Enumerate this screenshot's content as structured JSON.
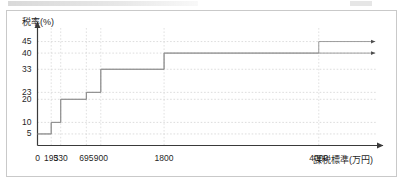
{
  "figure": {
    "title": "",
    "y_axis_label": "税率(%)",
    "x_axis_label": "課税標準(万円)"
  },
  "chart_data": {
    "type": "line",
    "subtype": "step-post",
    "title": "",
    "xlabel": "課税標準(万円)",
    "ylabel": "税率(%)",
    "grid": true,
    "grid_style": "dashed",
    "legend_position": "none",
    "x_ticks": [
      0,
      195,
      330,
      695,
      900,
      1800,
      4000
    ],
    "x_tick_labels": [
      "0",
      "195",
      "330",
      "695",
      "900",
      "1800",
      "4000"
    ],
    "y_ticks": [
      5,
      10,
      20,
      23,
      33,
      40,
      45
    ],
    "y_tick_labels": [
      "5",
      "10",
      "20",
      "23",
      "33",
      "40",
      "45"
    ],
    "xlim": [
      0,
      4800
    ],
    "ylim": [
      0,
      50
    ],
    "x_axis_arrow": true,
    "y_axis_arrow": true,
    "series": [
      {
        "name": "tax-rate-upper",
        "arrow_end": true,
        "max_rate": 45,
        "steps": [
          {
            "from": 0,
            "to": 195,
            "rate": 5
          },
          {
            "from": 195,
            "to": 330,
            "rate": 10
          },
          {
            "from": 330,
            "to": 695,
            "rate": 20
          },
          {
            "from": 695,
            "to": 900,
            "rate": 23
          },
          {
            "from": 900,
            "to": 1800,
            "rate": 33
          },
          {
            "from": 1800,
            "to": 4000,
            "rate": 40
          },
          {
            "from": 4000,
            "to": 4800,
            "rate": 45
          }
        ]
      },
      {
        "name": "tax-rate-lower",
        "arrow_end": true,
        "max_rate": 40,
        "steps": [
          {
            "from": 0,
            "to": 195,
            "rate": 5
          },
          {
            "from": 195,
            "to": 330,
            "rate": 10
          },
          {
            "from": 330,
            "to": 695,
            "rate": 20
          },
          {
            "from": 695,
            "to": 900,
            "rate": 23
          },
          {
            "from": 900,
            "to": 1800,
            "rate": 33
          },
          {
            "from": 1800,
            "to": 4800,
            "rate": 40
          }
        ]
      }
    ]
  }
}
